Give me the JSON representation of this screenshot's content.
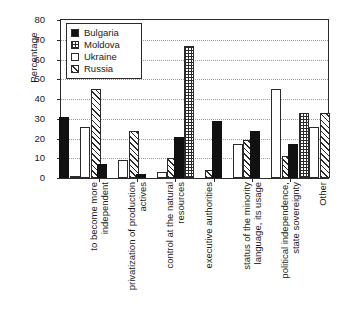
{
  "chart_data": {
    "type": "bar",
    "title": "",
    "xlabel": "",
    "ylabel": "Percentage",
    "ylim": [
      0,
      80
    ],
    "ytick_step": 10,
    "yticks": [
      0,
      10,
      20,
      30,
      40,
      50,
      60,
      70,
      80
    ],
    "grid": true,
    "legend_position": "upper left",
    "categories": [
      "to become more independent",
      "privatization of production actives",
      "control at the natural resources",
      "executive authorities",
      "status of the minority language, its usage",
      "political independence, state sovereignty",
      "Other"
    ],
    "category_lines": [
      [
        "to become more",
        "independent"
      ],
      [
        "privatization of production",
        "actives"
      ],
      [
        "control at the natural",
        "resources"
      ],
      [
        "executive authorities"
      ],
      [
        "status of the minority",
        "language, its usage"
      ],
      [
        "political independence,",
        "state sovereignty"
      ],
      [
        "Other"
      ]
    ],
    "series": [
      {
        "name": "Bulgaria",
        "pattern": "solid",
        "values": [
          31,
          7,
          2,
          21,
          29,
          24,
          17
        ]
      },
      {
        "name": "Moldova",
        "pattern": "dots",
        "values": [
          1,
          0,
          0,
          67,
          0,
          0,
          33
        ]
      },
      {
        "name": "Ukraine",
        "pattern": "empty",
        "values": [
          26,
          9,
          3,
          0,
          17,
          45,
          26
        ]
      },
      {
        "name": "Russia",
        "pattern": "diag",
        "values": [
          45,
          24,
          10,
          4,
          19,
          11,
          33
        ]
      }
    ]
  },
  "legend": {
    "items": [
      {
        "label": "Bulgaria",
        "pattern": "solid"
      },
      {
        "label": "Moldova",
        "pattern": "dots"
      },
      {
        "label": "Ukraine",
        "pattern": "empty"
      },
      {
        "label": "Russia",
        "pattern": "diag"
      }
    ]
  }
}
